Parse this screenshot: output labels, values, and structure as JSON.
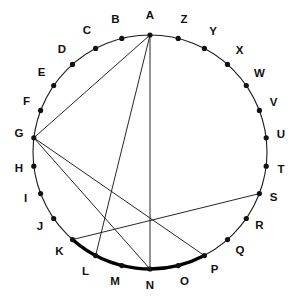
{
  "figure": {
    "type": "geometry-diagram",
    "background_color": "#ffffff",
    "stroke_color": "#1a1a1a",
    "highlight_color": "#000000",
    "circle": {
      "center_x": 150,
      "center_y": 152,
      "radius": 117,
      "point_count": 26
    },
    "points": [
      {
        "label": "A",
        "angle_deg": 90,
        "x": 150.0,
        "y": 35.0,
        "label_x": 150.0,
        "label_y": 16.0
      },
      {
        "label": "B",
        "angle_deg": 103.8,
        "x": 121.8,
        "y": 38.4,
        "label_x": 115.5,
        "label_y": 20.0
      },
      {
        "label": "C",
        "angle_deg": 117.7,
        "x": 95.6,
        "y": 48.4,
        "label_x": 87.0,
        "label_y": 31.0
      },
      {
        "label": "D",
        "angle_deg": 131.5,
        "x": 72.5,
        "y": 64.4,
        "label_x": 62.0,
        "label_y": 49.5
      },
      {
        "label": "E",
        "angle_deg": 145.4,
        "x": 53.7,
        "y": 85.5,
        "label_x": 41.5,
        "label_y": 73.0
      },
      {
        "label": "F",
        "angle_deg": 159.2,
        "x": 40.6,
        "y": 110.4,
        "label_x": 26.5,
        "label_y": 101.5
      },
      {
        "label": "G",
        "angle_deg": 173.1,
        "x": 33.8,
        "y": 137.8,
        "label_x": 19.0,
        "label_y": 134.0
      },
      {
        "label": "H",
        "angle_deg": 186.9,
        "x": 33.8,
        "y": 166.2,
        "label_x": 19.0,
        "label_y": 169.0
      },
      {
        "label": "I",
        "angle_deg": 200.8,
        "x": 40.6,
        "y": 193.6,
        "label_x": 25.5,
        "label_y": 198.5
      },
      {
        "label": "J",
        "angle_deg": 214.6,
        "x": 53.7,
        "y": 218.5,
        "label_x": 40.0,
        "label_y": 227.0
      },
      {
        "label": "K",
        "angle_deg": 228.5,
        "x": 72.5,
        "y": 239.6,
        "label_x": 59.5,
        "label_y": 252.0
      },
      {
        "label": "L",
        "angle_deg": 242.3,
        "x": 95.6,
        "y": 255.6,
        "label_x": 85.5,
        "label_y": 271.5
      },
      {
        "label": "M",
        "angle_deg": 256.2,
        "x": 121.8,
        "y": 265.6,
        "label_x": 115.0,
        "label_y": 282.0
      },
      {
        "label": "N",
        "angle_deg": 270,
        "x": 150.0,
        "y": 269.0,
        "label_x": 150.0,
        "label_y": 285.5
      },
      {
        "label": "O",
        "angle_deg": 283.8,
        "x": 178.2,
        "y": 265.6,
        "label_x": 184.5,
        "label_y": 282.0
      },
      {
        "label": "P",
        "angle_deg": 297.7,
        "x": 204.4,
        "y": 255.6,
        "label_x": 214.5,
        "label_y": 269.5
      },
      {
        "label": "Q",
        "angle_deg": 311.5,
        "x": 227.5,
        "y": 239.6,
        "label_x": 240.0,
        "label_y": 251.0
      },
      {
        "label": "R",
        "angle_deg": 325.4,
        "x": 246.3,
        "y": 218.5,
        "label_x": 259.5,
        "label_y": 226.0
      },
      {
        "label": "S",
        "angle_deg": 339.2,
        "x": 259.4,
        "y": 193.6,
        "label_x": 273.5,
        "label_y": 197.5
      },
      {
        "label": "T",
        "angle_deg": 353.1,
        "x": 266.2,
        "y": 166.2,
        "label_x": 281.0,
        "label_y": 169.5
      },
      {
        "label": "U",
        "angle_deg": 6.9,
        "x": 266.2,
        "y": 137.8,
        "label_x": 281.0,
        "label_y": 135.0
      },
      {
        "label": "V",
        "angle_deg": 20.8,
        "x": 259.4,
        "y": 110.4,
        "label_x": 273.5,
        "label_y": 102.5
      },
      {
        "label": "W",
        "angle_deg": 34.6,
        "x": 246.3,
        "y": 85.5,
        "label_x": 259.5,
        "label_y": 74.0
      },
      {
        "label": "X",
        "angle_deg": 48.5,
        "x": 227.5,
        "y": 64.4,
        "label_x": 239.5,
        "label_y": 50.5
      },
      {
        "label": "Y",
        "angle_deg": 62.3,
        "x": 204.4,
        "y": 48.4,
        "label_x": 213.0,
        "label_y": 32.0
      },
      {
        "label": "Z",
        "angle_deg": 76.2,
        "x": 178.2,
        "y": 38.4,
        "label_x": 184.0,
        "label_y": 20.0
      }
    ],
    "chords": [
      {
        "name": "chord-A-G",
        "from": "A",
        "to": "G"
      },
      {
        "name": "chord-A-L",
        "from": "A",
        "to": "L"
      },
      {
        "name": "chord-A-N",
        "from": "A",
        "to": "N"
      },
      {
        "name": "chord-G-N",
        "from": "G",
        "to": "N"
      },
      {
        "name": "chord-G-P",
        "from": "G",
        "to": "P"
      },
      {
        "name": "chord-K-S",
        "from": "K",
        "to": "S"
      }
    ],
    "highlighted_arc": {
      "name": "arc-K-to-P",
      "from": "K",
      "to": "P",
      "passes_through": [
        "L",
        "M",
        "N",
        "O"
      ]
    }
  }
}
